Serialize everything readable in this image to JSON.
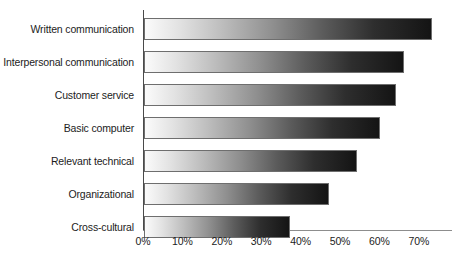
{
  "chart_data": {
    "type": "bar",
    "orientation": "horizontal",
    "title": "",
    "subtitle": "",
    "xlabel": "",
    "ylabel": "",
    "categories": [
      "Written communication",
      "Interpersonal communication",
      "Customer service",
      "Basic computer",
      "Relevant technical",
      "Organizational",
      "Cross-cultural"
    ],
    "values": [
      73,
      66,
      64,
      60,
      54,
      47,
      37
    ],
    "value_suffix": "%",
    "xlim": [
      0,
      78
    ],
    "xticks": [
      0,
      10,
      20,
      30,
      40,
      50,
      60,
      70
    ],
    "xticklabels": [
      "0%",
      "10%",
      "20%",
      "30%",
      "40%",
      "50%",
      "60%",
      "70%"
    ],
    "grid": false,
    "legend": false,
    "legend_position": "none",
    "series": [
      {
        "name": "Percent of employers",
        "values": [
          73,
          66,
          64,
          60,
          54,
          47,
          37
        ]
      }
    ],
    "style": {
      "bar_fill": "gradient-white-to-black",
      "bar_gradient_start": "#fbfbfb",
      "bar_gradient_end": "#141414",
      "bar_border": "#6e6e6e",
      "axis_color": "#4a4a4a",
      "background": "#ffffff",
      "text_color": "#1c1c1c"
    }
  }
}
